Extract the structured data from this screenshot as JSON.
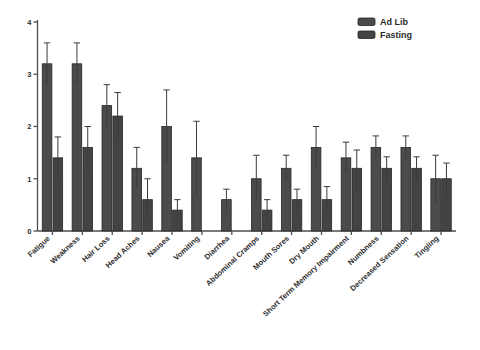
{
  "chart_data": {
    "type": "bar",
    "title": "",
    "xlabel": "",
    "ylabel": "",
    "ylim": [
      0,
      4
    ],
    "yticks": [
      0,
      1,
      2,
      3,
      4
    ],
    "ytick_labels": [
      "0",
      "1",
      "2",
      "3",
      "4"
    ],
    "grid": false,
    "legend_position": "top-right",
    "colors": {
      "ad_lib": "#4b4b4b",
      "fasting": "#434343",
      "axis": "#4e4e4e",
      "error_bar": "#3b3b3b",
      "background": "#ffffff"
    },
    "categories": [
      "Fatigue",
      "Weakness",
      "Hair Loss",
      "Head Aches",
      "Nausea",
      "Vomiting",
      "Diarrhea",
      "Abdominal Cramps",
      "Mouth Sores",
      "Dry Mouth",
      "Short Term Memory Impairment",
      "Numbness",
      "Decreased Sensation",
      "Tingling"
    ],
    "series": [
      {
        "name": "Ad Lib",
        "values": [
          3.2,
          3.2,
          2.4,
          1.2,
          2.0,
          1.4,
          0.6,
          1.0,
          1.2,
          1.6,
          1.4,
          1.6,
          1.6,
          1.0
        ],
        "errors": [
          0.4,
          0.4,
          0.4,
          0.4,
          0.7,
          0.7,
          0.2,
          0.45,
          0.25,
          0.4,
          0.3,
          0.22,
          0.22,
          0.45
        ]
      },
      {
        "name": "Fasting",
        "values": [
          1.4,
          1.6,
          2.2,
          0.6,
          0.4,
          null,
          null,
          0.4,
          0.6,
          0.6,
          1.2,
          1.2,
          1.2,
          1.0
        ],
        "errors": [
          0.4,
          0.4,
          0.45,
          0.4,
          0.2,
          null,
          null,
          0.2,
          0.2,
          0.25,
          0.35,
          0.22,
          0.22,
          0.3
        ]
      }
    ]
  },
  "legend": {
    "items": [
      {
        "label": "Ad Lib",
        "color": "#4b4b4b"
      },
      {
        "label": "Fasting",
        "color": "#434343"
      }
    ]
  }
}
